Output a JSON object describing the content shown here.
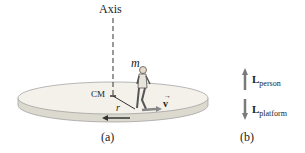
{
  "diagram": {
    "panel_a": {
      "axis_label": "Axis",
      "mass_label": "m",
      "cm_label": "CM",
      "radius_label": "r",
      "velocity_label": "v",
      "caption": "(a)"
    },
    "panel_b": {
      "person_vector": {
        "symbol": "L",
        "subscript": "person",
        "direction": "up"
      },
      "platform_vector": {
        "symbol": "L",
        "subscript": "platform",
        "direction": "down"
      },
      "caption": "(b)"
    },
    "colors": {
      "platform_top": "#f3f1ea",
      "platform_edge": "#dcd9cf",
      "arrow_gray": "#7a7a7a",
      "text": "#222222"
    }
  }
}
